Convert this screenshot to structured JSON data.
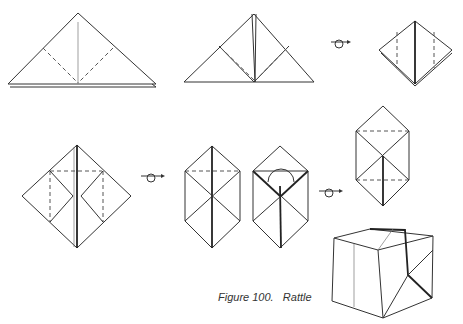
{
  "figure": {
    "caption_number": "Figure 100.",
    "caption_title": "Rattle",
    "steps": [
      {
        "id": 1,
        "shape": "triangle",
        "note": "folded triangle with dashed diagonal valley folds"
      },
      {
        "id": 2,
        "shape": "triangle",
        "note": "corners folded up to top"
      },
      {
        "id": 3,
        "shape": "square-diamond",
        "note": "preliminary diamond with dashed vertical folds"
      },
      {
        "id": 4,
        "shape": "diamond",
        "note": "side flaps folded in, dashed horizontal fold"
      },
      {
        "id": 5,
        "shape": "hexagon",
        "note": "elongated hexagon with dashed horizontal fold"
      },
      {
        "id": 6,
        "shape": "hexagon",
        "note": "top flaps folded with pocket"
      },
      {
        "id": 7,
        "shape": "hexagon",
        "note": "both sides dashed horizontal folds"
      },
      {
        "id": 8,
        "shape": "cube",
        "note": "finished rattle cube"
      }
    ],
    "turn_over_symbols": 3,
    "colors": {
      "line": "#333333",
      "background": "#ffffff"
    }
  }
}
